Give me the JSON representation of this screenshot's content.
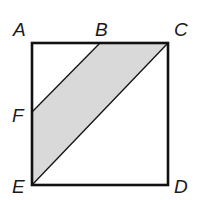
{
  "figure": {
    "type": "geometry-diagram",
    "colors": {
      "stroke": "#111111",
      "shade": "#d9d9d9",
      "background": "#ffffff"
    },
    "points": [
      {
        "name": "A",
        "x": 32,
        "y": 43
      },
      {
        "name": "B",
        "x": 100,
        "y": 43
      },
      {
        "name": "C",
        "x": 168,
        "y": 43
      },
      {
        "name": "D",
        "x": 168,
        "y": 185
      },
      {
        "name": "E",
        "x": 32,
        "y": 185
      },
      {
        "name": "F",
        "x": 32,
        "y": 112
      }
    ],
    "labels": {
      "A": "A",
      "B": "B",
      "C": "C",
      "D": "D",
      "E": "E",
      "F": "F"
    },
    "shaded_region": [
      "B",
      "C",
      "E",
      "F"
    ]
  }
}
